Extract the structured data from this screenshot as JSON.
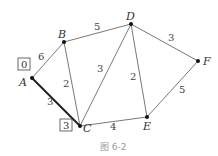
{
  "nodes": [
    {
      "id": "A",
      "label": "A",
      "x": 32,
      "y": 78,
      "lx": 19,
      "ly": 86
    },
    {
      "id": "B",
      "label": "B",
      "x": 64,
      "y": 42,
      "lx": 58,
      "ly": 38
    },
    {
      "id": "C",
      "label": "C",
      "x": 80,
      "y": 126,
      "lx": 83,
      "ly": 132
    },
    {
      "id": "D",
      "label": "D",
      "x": 131,
      "y": 24,
      "lx": 126,
      "ly": 20
    },
    {
      "id": "E",
      "label": "E",
      "x": 147,
      "y": 117,
      "lx": 143,
      "ly": 130
    },
    {
      "id": "F",
      "label": "F",
      "x": 198,
      "y": 61,
      "lx": 203,
      "ly": 65
    }
  ],
  "edges": [
    {
      "from": "A",
      "to": "B",
      "weight": "6",
      "wx": 38,
      "wy": 60,
      "bold": false
    },
    {
      "from": "A",
      "to": "C",
      "weight": "3",
      "wx": 47,
      "wy": 105,
      "bold": true
    },
    {
      "from": "B",
      "to": "C",
      "weight": "2",
      "wx": 63,
      "wy": 87,
      "bold": false
    },
    {
      "from": "B",
      "to": "D",
      "weight": "5",
      "wx": 94,
      "wy": 30,
      "bold": false
    },
    {
      "from": "C",
      "to": "D",
      "weight": "3",
      "wx": 97,
      "wy": 72,
      "bold": false
    },
    {
      "from": "D",
      "to": "E",
      "weight": "2",
      "wx": 130,
      "wy": 80,
      "bold": false
    },
    {
      "from": "C",
      "to": "E",
      "weight": "4",
      "wx": 110,
      "wy": 130,
      "bold": false
    },
    {
      "from": "D",
      "to": "F",
      "weight": "3",
      "wx": 168,
      "wy": 41,
      "bold": false
    },
    {
      "from": "E",
      "to": "F",
      "weight": "5",
      "wx": 179,
      "wy": 93,
      "bold": false
    }
  ],
  "boxes": [
    {
      "node": "A",
      "value": "0",
      "x": 18,
      "y": 58
    },
    {
      "node": "C",
      "value": "3",
      "x": 60,
      "y": 119
    }
  ],
  "caption": "图 6-2"
}
